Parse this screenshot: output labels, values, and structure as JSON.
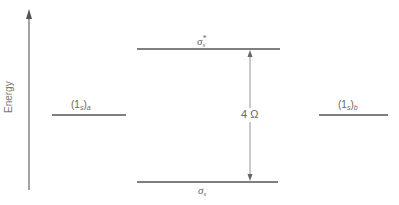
{
  "diagram": {
    "type": "molecular-orbital-energy-level",
    "axis": {
      "label": "Energy",
      "direction": "up"
    },
    "levels": [
      {
        "id": "atomic-a",
        "label": "(1",
        "sub": "s",
        "close": ")",
        "atom_sub": "a"
      },
      {
        "id": "antibonding",
        "label": "σ",
        "sub": "s",
        "sup": "*"
      },
      {
        "id": "bonding",
        "label": "σ",
        "sub": "s"
      },
      {
        "id": "atomic-b",
        "label": "(1",
        "sub": "s",
        "close": ")",
        "atom_sub": "b"
      }
    ],
    "splitting": {
      "label": "4 Ω"
    }
  },
  "colors": {
    "line": "#555555",
    "text": "#666666"
  }
}
